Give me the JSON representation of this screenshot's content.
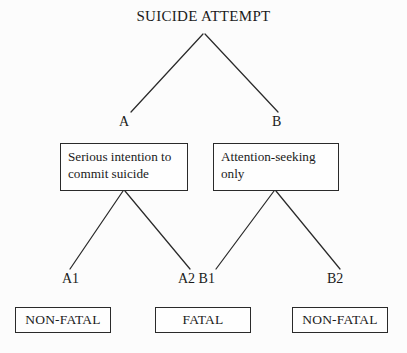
{
  "diagram": {
    "type": "decision-tree",
    "title": "SUICIDE ATTEMPT",
    "background_color": "#fcfcfc",
    "line_color": "#2a2a2a",
    "branches": {
      "a_label": "A",
      "b_label": "B",
      "a1_label": "A1",
      "a2_b1_label": "A2 B1",
      "b2_label": "B2"
    },
    "intent_boxes": {
      "serious": "Serious intention to\ncommit suicide",
      "attention": "Attention-seeking\nonly"
    },
    "outcome_boxes": {
      "left": "NON-FATAL",
      "middle": "FATAL",
      "right": "NON-FATAL"
    }
  }
}
